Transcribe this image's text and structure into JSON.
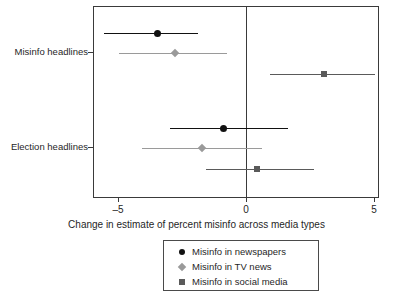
{
  "chart_data": {
    "type": "scatter",
    "subtype": "dot-and-whisker coefficient plot",
    "title": "",
    "xlabel": "Change in estimate of percent misinfo across media types",
    "ylabel": "",
    "xlim": [
      -5.6,
      5.2
    ],
    "xticks": [
      -5,
      0,
      5
    ],
    "xticklabels": [
      "–5",
      "0",
      "5"
    ],
    "categories": [
      "Misinfo headlines",
      "Election headlines"
    ],
    "grid": false,
    "zero_reference_line": 0,
    "legend_position": "below-axis",
    "series": [
      {
        "name": "Misinfo in newspapers",
        "marker": "circle",
        "color": "#111111",
        "points": [
          {
            "category": "Misinfo headlines",
            "estimate": -3.5,
            "ci_low": -5.6,
            "ci_high": -1.9
          },
          {
            "category": "Election headlines",
            "estimate": -0.9,
            "ci_low": -3.0,
            "ci_high": 1.6
          }
        ]
      },
      {
        "name": "Misinfo in TV news",
        "marker": "diamond",
        "color": "#9a9a9a",
        "points": [
          {
            "category": "Misinfo headlines",
            "estimate": -2.8,
            "ci_low": -5.0,
            "ci_high": -0.8
          },
          {
            "category": "Election headlines",
            "estimate": -1.75,
            "ci_low": -4.1,
            "ci_high": 0.6
          }
        ]
      },
      {
        "name": "Misinfo in social media",
        "marker": "square",
        "color": "#5a5a5a",
        "points": [
          {
            "category": "Misinfo headlines",
            "estimate": 3.0,
            "ci_low": 0.9,
            "ci_high": 5.0
          },
          {
            "category": "Election headlines",
            "estimate": 0.4,
            "ci_low": -1.6,
            "ci_high": 2.6
          }
        ]
      }
    ]
  },
  "axis": {
    "x_title": "Change in estimate of percent misinfo across media types",
    "x_tick_labels": [
      "–5",
      "0",
      "5"
    ],
    "y_tick_labels": [
      "Misinfo headlines",
      "Election headlines"
    ]
  },
  "legend": {
    "items": [
      {
        "label": "Misinfo in newspapers",
        "marker": "circle",
        "color": "#111111"
      },
      {
        "label": "Misinfo in TV news",
        "marker": "diamond",
        "color": "#9a9a9a"
      },
      {
        "label": "Misinfo in social media",
        "marker": "square",
        "color": "#5a5a5a"
      }
    ]
  },
  "colors": {
    "newspapers": "#111111",
    "tv_news": "#9a9a9a",
    "social_media": "#5a5a5a",
    "axis": "#3a3a3a",
    "background": "#ffffff"
  }
}
